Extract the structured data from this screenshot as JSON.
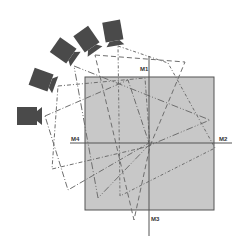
{
  "diagram": {
    "type": "camera-coverage",
    "colors": {
      "background": "#ffffff",
      "area_fill": "#c8c8c8",
      "area_stroke": "#555555",
      "axis": "#555555",
      "camera": "#4a4a4a",
      "fov_line": "#6e6e6e"
    },
    "area": {
      "x": 85,
      "y": 77,
      "width": 129,
      "height": 133
    },
    "axes": {
      "vertical": {
        "x": 149,
        "y1": 56,
        "y2": 236
      },
      "horizontal": {
        "y": 143,
        "x1": 70,
        "x2": 232
      }
    },
    "labels": {
      "m1": {
        "text": "M1",
        "x": 140,
        "y": 71
      },
      "m2": {
        "text": "M2",
        "x": 219,
        "y": 141
      },
      "m3": {
        "text": "M3",
        "x": 151,
        "y": 221
      },
      "m4": {
        "text": "M4",
        "x": 71,
        "y": 141
      }
    },
    "cameras": [
      {
        "id": "camera-1",
        "cx": 28,
        "cy": 116,
        "angle": 0
      },
      {
        "id": "camera-2",
        "cx": 42,
        "cy": 80,
        "angle": 20
      },
      {
        "id": "camera-3",
        "cx": 64,
        "cy": 51,
        "angle": 35
      },
      {
        "id": "camera-4",
        "cx": 87,
        "cy": 40,
        "angle": 55
      },
      {
        "id": "camera-5",
        "cx": 113,
        "cy": 32,
        "angle": 80
      }
    ],
    "fields_of_view": [
      {
        "camera": "camera-1",
        "points": [
          [
            45,
            116
          ],
          [
            128,
            80
          ],
          [
            149,
            143
          ],
          [
            68,
            190
          ]
        ]
      },
      {
        "camera": "camera-2",
        "points": [
          [
            58,
            86
          ],
          [
            145,
            78
          ],
          [
            150,
            146
          ],
          [
            52,
            169
          ]
        ]
      },
      {
        "camera": "camera-3",
        "points": [
          [
            74,
            66
          ],
          [
            210,
            120
          ],
          [
            148,
            146
          ],
          [
            98,
            198
          ]
        ]
      },
      {
        "camera": "camera-4",
        "points": [
          [
            95,
            55
          ],
          [
            185,
            62
          ],
          [
            150,
            146
          ],
          [
            134,
            220
          ]
        ]
      },
      {
        "camera": "camera-5",
        "points": [
          [
            118,
            46
          ],
          [
            168,
            63
          ],
          [
            215,
            148
          ],
          [
            120,
            196
          ]
        ]
      }
    ]
  }
}
